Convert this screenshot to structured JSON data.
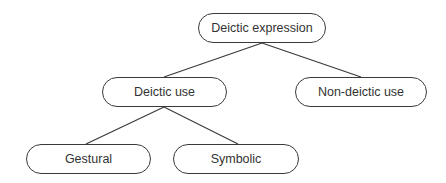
{
  "diagram": {
    "type": "tree",
    "nodes": [
      {
        "id": "root",
        "label": "Deictic expression",
        "x": 198,
        "y": 13,
        "w": 128,
        "h": 30
      },
      {
        "id": "deictic",
        "label": "Deictic use",
        "x": 102,
        "y": 77,
        "w": 125,
        "h": 30
      },
      {
        "id": "nondeictic",
        "label": "Non-deictic use",
        "x": 295,
        "y": 77,
        "w": 132,
        "h": 30
      },
      {
        "id": "gestural",
        "label": "Gestural",
        "x": 26,
        "y": 144,
        "w": 125,
        "h": 30
      },
      {
        "id": "symbolic",
        "label": "Symbolic",
        "x": 173,
        "y": 144,
        "w": 126,
        "h": 30
      }
    ],
    "edges": [
      {
        "from": "root",
        "to": "deictic"
      },
      {
        "from": "root",
        "to": "nondeictic"
      },
      {
        "from": "deictic",
        "to": "gestural"
      },
      {
        "from": "deictic",
        "to": "symbolic"
      }
    ],
    "stroke_color": "#3a3a3a"
  }
}
